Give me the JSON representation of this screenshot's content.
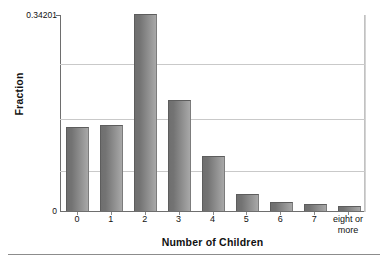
{
  "chart_data": {
    "type": "bar",
    "title": "",
    "subtitle": "",
    "xlabel": "Number of Children",
    "ylabel": "Fraction",
    "categories": [
      "0",
      "1",
      "2",
      "3",
      "4",
      "5",
      "6",
      "7",
      "eight or\nmore"
    ],
    "values": [
      0.145,
      0.1483,
      0.34201,
      0.192,
      0.0943,
      0.0279,
      0.014,
      0.0105,
      0.007
    ],
    "ylim": [
      0,
      0.34201
    ],
    "xlim_note": "categorical",
    "ytick_labels": [
      "0.34201",
      "0"
    ],
    "ytick_values": [
      0.34201,
      0
    ],
    "gridlines_at": [
      0.2565,
      0.161,
      0.07
    ],
    "grid": true,
    "legend": "none",
    "bar_color": "#7c7c7c",
    "bar_edge_color": "#5d5d5d",
    "grid_color": "#c9c9c9",
    "axis_color": "#6e6e6e",
    "background": "#ffffff",
    "annotations": []
  },
  "axes": {
    "y_title": "Fraction",
    "x_title": "Number of Children",
    "y_max_label": "0.34201",
    "y_min_label": "0"
  },
  "xticks": [
    {
      "label": "0"
    },
    {
      "label": "1"
    },
    {
      "label": "2"
    },
    {
      "label": "3"
    },
    {
      "label": "4"
    },
    {
      "label": "5"
    },
    {
      "label": "6"
    },
    {
      "label": "7"
    },
    {
      "label": "eight or\nmore"
    }
  ]
}
